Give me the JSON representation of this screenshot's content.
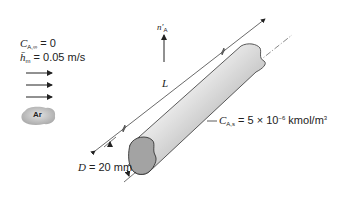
{
  "conditions": {
    "free_stream_conc": {
      "symbol": "C",
      "subscript": "A,∞",
      "value": "= 0"
    },
    "mass_transfer_coeff": {
      "symbol": "h̄",
      "subscript": "m",
      "value": "= 0.05 m/s"
    }
  },
  "gas": {
    "label": "Ar"
  },
  "flux": {
    "symbol": "n′",
    "subscript": "A"
  },
  "length": {
    "symbol": "L"
  },
  "surface_conc": {
    "symbol": "C",
    "subscript": "A,s",
    "value_prefix": "= 5 × 10",
    "exponent": "−6",
    "unit": " kmol/m",
    "unit_exp": "3"
  },
  "diameter": {
    "symbol": "D",
    "value": "= 20 mm"
  },
  "colors": {
    "cylinder_light": "#e6e6e6",
    "cylinder_dark": "#8a8a8a",
    "outline": "#333333",
    "cloud": "#c8c8c8"
  }
}
